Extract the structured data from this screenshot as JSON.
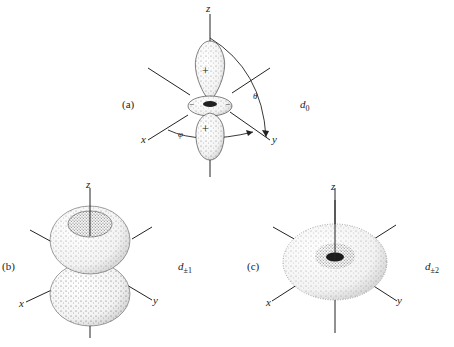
{
  "panels": [
    {
      "id": "a",
      "tag": "(a)",
      "orbital": "d",
      "orbital_sub": "0",
      "axes": {
        "z": "z",
        "x": "x",
        "y": "y"
      },
      "angles": {
        "theta": "θ",
        "phi": "φ"
      },
      "signs": {
        "top_lobe": "+",
        "ring": "−",
        "bottom_lobe": "+"
      }
    },
    {
      "id": "b",
      "tag": "(b)",
      "orbital": "d",
      "orbital_sub": "±1",
      "axes": {
        "z": "z",
        "x": "x",
        "y": "y"
      }
    },
    {
      "id": "c",
      "tag": "(c)",
      "orbital": "d",
      "orbital_sub": "±2",
      "axes": {
        "z": "z",
        "x": "x",
        "y": "y"
      }
    }
  ],
  "colors": {
    "ink": "#222222",
    "background": "#ffffff"
  }
}
